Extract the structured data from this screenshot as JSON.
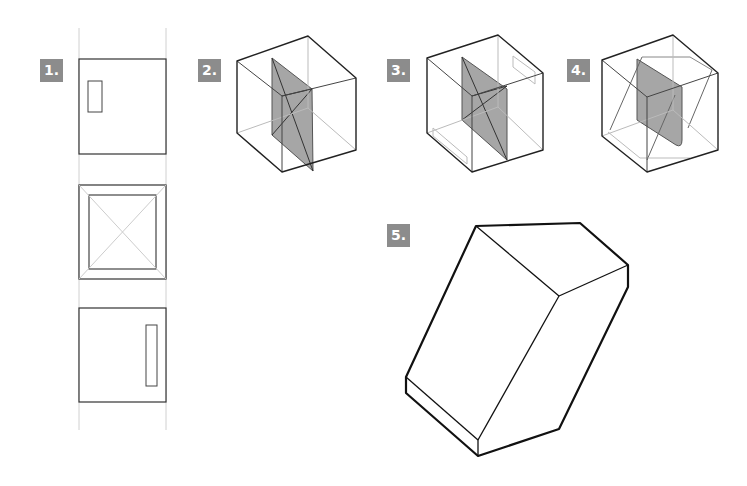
{
  "steps": [
    {
      "label": "1.",
      "description": "orthographic views: front, top, side"
    },
    {
      "label": "2.",
      "description": "cube with shaded diagonal plane"
    },
    {
      "label": "3.",
      "description": "cube with shaded plane and openings"
    },
    {
      "label": "4.",
      "description": "cube with shaded plane and rounded section"
    },
    {
      "label": "5.",
      "description": "resulting solid"
    }
  ],
  "colors": {
    "badge": "#8c8c8c",
    "badge_text": "#ffffff",
    "line": "#222222",
    "guide": "#cccccc",
    "shade": "#a6a6a6"
  }
}
